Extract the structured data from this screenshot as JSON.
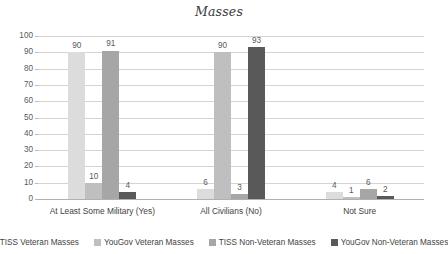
{
  "chart_data": {
    "type": "bar",
    "title": "Masses",
    "xlabel": "",
    "ylabel": "",
    "ylim": [
      0,
      100
    ],
    "yticks": [
      0,
      10,
      20,
      30,
      40,
      50,
      60,
      70,
      80,
      90,
      100
    ],
    "grid": true,
    "legend_position": "bottom",
    "categories": [
      "At Least Some Military (Yes)",
      "All Civilians (No)",
      "Not Sure"
    ],
    "series": [
      {
        "name": "TISS Veteran Masses",
        "color": "#dcdcdc",
        "values": [
          90,
          6,
          4
        ]
      },
      {
        "name": "YouGov Veteran Masses",
        "color": "#bfbfbf",
        "values": [
          10,
          90,
          1
        ]
      },
      {
        "name": "TISS Non-Veteran Masses",
        "color": "#a6a6a6",
        "values": [
          91,
          3,
          6
        ]
      },
      {
        "name": "YouGov Non-Veteran Masses",
        "color": "#595959",
        "values": [
          4,
          93,
          2
        ]
      }
    ]
  }
}
